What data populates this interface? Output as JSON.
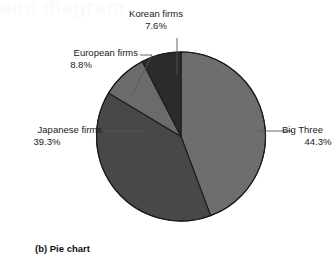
{
  "figure": {
    "caption": "(b) Pie chart",
    "bleed_text": "and diagram"
  },
  "chart_data": {
    "type": "pie",
    "title": "",
    "categories": [
      "Big Three",
      "Japanese firms",
      "European firms",
      "Korean firms"
    ],
    "values": [
      44.3,
      39.3,
      8.8,
      7.6
    ],
    "value_labels": [
      "44.3%",
      "39.3%",
      "8.8%",
      "7.6%"
    ],
    "colors": [
      "#6e6e6e",
      "#484848",
      "#6b6b6b",
      "#2b2b2b"
    ],
    "start_angle_deg": 0,
    "direction": "clockwise",
    "labels_position": "outside-with-leader-lines",
    "legend": "none",
    "grid": false,
    "slices": [
      {
        "name": "Big Three",
        "label": "Big Three",
        "percent_label": "44.3%",
        "value": 44.3,
        "color": "#6e6e6e",
        "start_deg": 0,
        "end_deg": 159.5
      },
      {
        "name": "Japanese firms",
        "label": "Japanese firms",
        "percent_label": "39.3%",
        "value": 39.3,
        "color": "#484848",
        "start_deg": 159.5,
        "end_deg": 301.0
      },
      {
        "name": "European firms",
        "label": "European firms",
        "percent_label": "8.8%",
        "value": 8.8,
        "color": "#6b6b6b",
        "start_deg": 301.0,
        "end_deg": 332.7
      },
      {
        "name": "Korean firms",
        "label": "Korean firms",
        "percent_label": "7.6%",
        "value": 7.6,
        "color": "#2b2b2b",
        "start_deg": 332.7,
        "end_deg": 360.0
      }
    ]
  }
}
